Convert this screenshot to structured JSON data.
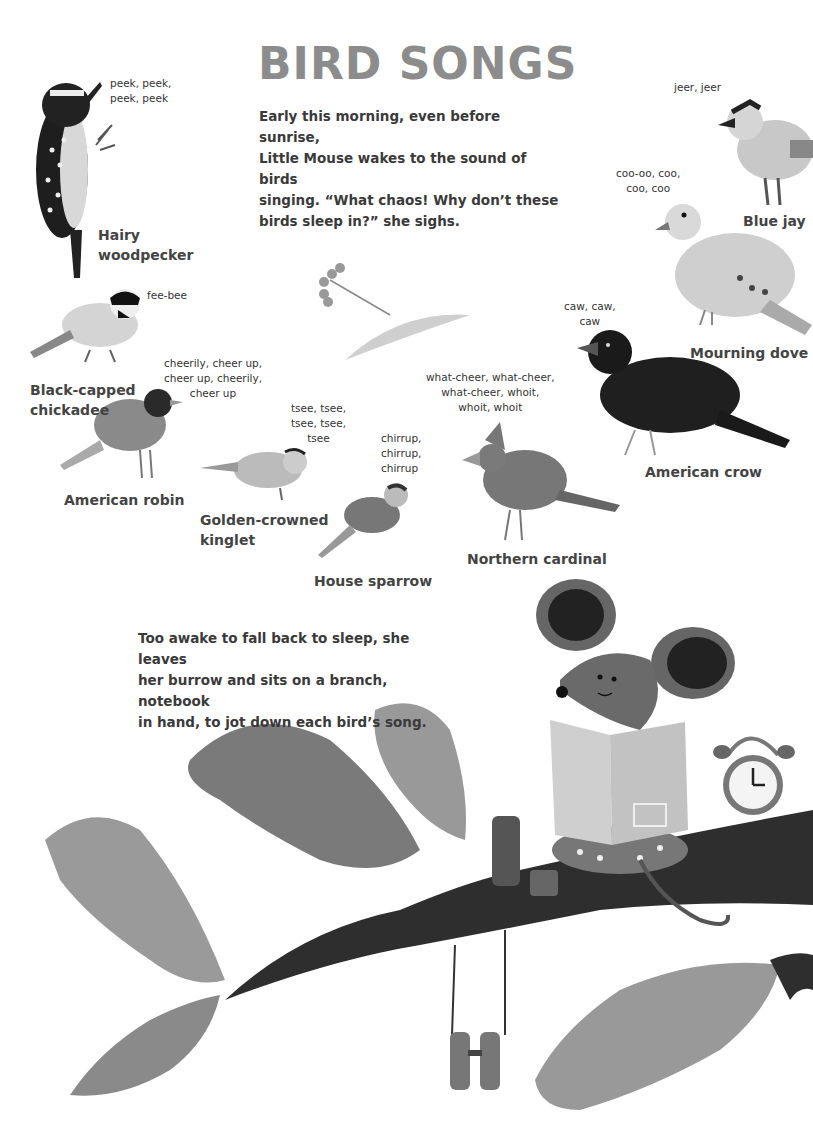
{
  "title": "BIRD SONGS",
  "intro": [
    "Early this morning, even before sunrise,",
    "Little Mouse wakes to the sound of birds",
    "singing. “What chaos! Why don’t these",
    "birds sleep in?” she sighs."
  ],
  "outro": [
    "Too awake to fall back to sleep, she leaves",
    "her burrow and sits on a branch, notebook",
    "in hand, to jot down each bird’s song."
  ],
  "birds": [
    {
      "name": [
        "Hairy",
        "woodpecker"
      ],
      "song": [
        "peek, peek,",
        "peek, peek"
      ]
    },
    {
      "name": [
        "Blue jay"
      ],
      "song": [
        "jeer, jeer"
      ]
    },
    {
      "name": [
        "Mourning dove"
      ],
      "song": [
        "coo-oo, coo,",
        "coo, coo"
      ]
    },
    {
      "name": [
        "Black-capped",
        "chickadee"
      ],
      "song": [
        "fee-bee"
      ]
    },
    {
      "name": [
        "American robin"
      ],
      "song": [
        "cheerily, cheer up,",
        "cheer up, cheerily,",
        "cheer up"
      ]
    },
    {
      "name": [
        "Golden-crowned",
        "kinglet"
      ],
      "song": [
        "tsee, tsee,",
        "tsee, tsee,",
        "tsee"
      ]
    },
    {
      "name": [
        "House sparrow"
      ],
      "song": [
        "chirrup,",
        "chirrup,",
        "chirrup"
      ]
    },
    {
      "name": [
        "Northern cardinal"
      ],
      "song": [
        "what-cheer, what-cheer,",
        "what-cheer, whoit,",
        "whoit, whoit"
      ]
    },
    {
      "name": [
        "American crow"
      ],
      "song": [
        "caw, caw,",
        "caw"
      ]
    }
  ],
  "illustrations": {
    "clock_numbers": [
      "12",
      "1",
      "2",
      "3",
      "4",
      "5",
      "6",
      "7",
      "8",
      "9",
      "10",
      "11"
    ],
    "colors": {
      "title": "#8c8c8c",
      "branch": "#2e2e2e",
      "leaf": "#8a8a8a",
      "mouse": "#666666",
      "book": "#c9c9c9"
    }
  }
}
